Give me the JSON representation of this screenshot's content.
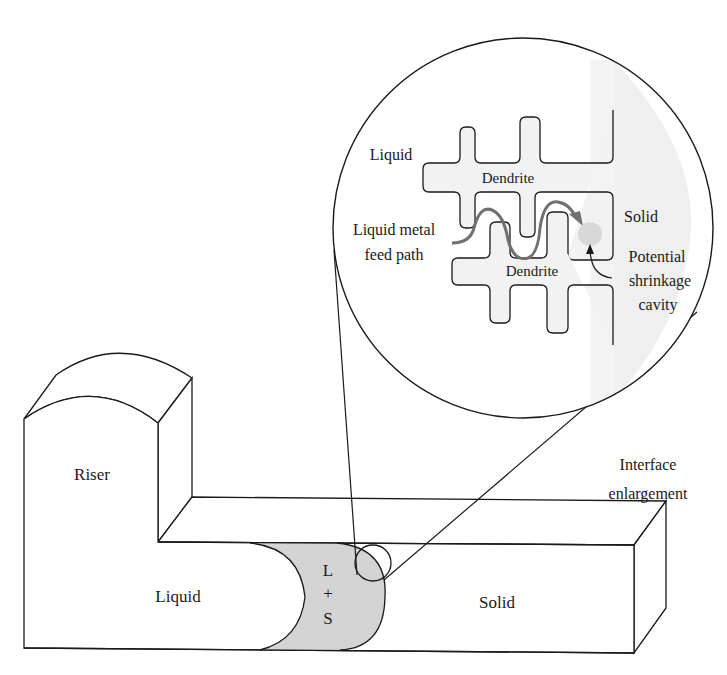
{
  "figure": {
    "type": "casting solidification interface diagram",
    "colors": {
      "line": "#1a1a1a",
      "mushy_zone_fill": "#d4d4d4",
      "enlargement_fill": "#f0f0f0",
      "feed_path": "#707070",
      "cavity": "#d8d8d8"
    }
  },
  "casting": {
    "riser_label": "Riser",
    "liquid_label": "Liquid",
    "mushy_zone": {
      "line1": "L",
      "line2": "+",
      "line3": "S"
    },
    "solid_label": "Solid"
  },
  "callout": {
    "label_line1": "Interface",
    "label_line2": "enlargement"
  },
  "enlargement": {
    "liquid_label": "Liquid",
    "dendrite_top_label": "Dendrite",
    "dendrite_bottom_label": "Dendrite",
    "solid_label": "Solid",
    "feed_path_label_line1": "Liquid metal",
    "feed_path_label_line2": "feed path",
    "cavity_label_line1": "Potential",
    "cavity_label_line2": "shrinkage",
    "cavity_label_line3": "cavity"
  }
}
